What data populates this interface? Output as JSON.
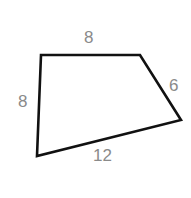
{
  "shape": {
    "type": "quadrilateral",
    "stroke": "#111111",
    "vertices": [
      [
        41,
        55
      ],
      [
        140,
        55
      ],
      [
        181,
        120
      ],
      [
        37,
        156
      ]
    ],
    "sides": {
      "top": "8",
      "right": "6",
      "bottom": "12",
      "left": "8"
    }
  },
  "label_color": "#8a8a8a"
}
